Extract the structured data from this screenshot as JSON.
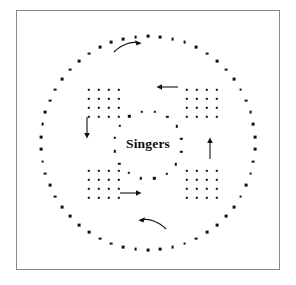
{
  "figure": {
    "title": "Singers",
    "background_color": "#ffffff",
    "frame": {
      "border_color": "#8a8a8a",
      "fill": "#ffffff"
    },
    "mark_color": "#111111"
  },
  "center_label": {
    "text": "Singers"
  },
  "chart_data": {
    "type": "scatter",
    "title": "Singers",
    "xlabel": "",
    "ylabel": "",
    "grid": false,
    "legend": false,
    "xlim": [
      0,
      296
    ],
    "ylim": [
      0,
      285
    ],
    "series": [
      {
        "name": "outer-ring",
        "marker": "square-dot",
        "count": 54,
        "center": [
          148,
          143
        ],
        "radius": 107,
        "start_angle_deg": -90,
        "note": "evenly spaced dots forming a large circle"
      },
      {
        "name": "inner-ring",
        "marker": "square-dot",
        "count": 16,
        "center": [
          148,
          145
        ],
        "radius": 34,
        "start_angle_deg": -78,
        "note": "sparse scattered dots encircling the center label"
      },
      {
        "name": "block-top-left",
        "marker": "square-dot",
        "rows": 4,
        "cols": 4,
        "origin": [
          89,
          90
        ],
        "spacing": [
          10,
          9
        ]
      },
      {
        "name": "block-top-right",
        "marker": "square-dot",
        "rows": 4,
        "cols": 4,
        "origin": [
          187,
          90
        ],
        "spacing": [
          10,
          9
        ]
      },
      {
        "name": "block-bottom-left",
        "marker": "square-dot",
        "rows": 4,
        "cols": 4,
        "origin": [
          89,
          171
        ],
        "spacing": [
          10,
          9
        ]
      },
      {
        "name": "block-bottom-right",
        "marker": "square-dot",
        "rows": 4,
        "cols": 4,
        "origin": [
          187,
          171
        ],
        "spacing": [
          10,
          9
        ]
      }
    ],
    "annotations": [
      {
        "name": "arrow-top",
        "style": "curved",
        "direction": "right",
        "x": 118,
        "y": 46
      },
      {
        "name": "arrow-left",
        "style": "straight",
        "direction": "down",
        "x": 86,
        "y": 120
      },
      {
        "name": "arrow-right",
        "style": "straight",
        "direction": "up",
        "x": 209,
        "y": 140
      },
      {
        "name": "arrow-bottom",
        "style": "curved",
        "direction": "left",
        "x": 141,
        "y": 222
      },
      {
        "name": "arrow-upper-right",
        "style": "straight",
        "direction": "left",
        "x": 161,
        "y": 87
      },
      {
        "name": "arrow-lower-left",
        "style": "straight",
        "direction": "right",
        "x": 125,
        "y": 193
      }
    ]
  }
}
